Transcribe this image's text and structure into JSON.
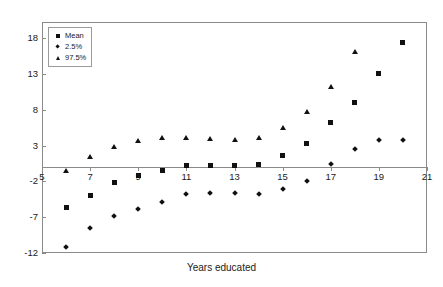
{
  "chart_data": {
    "type": "scatter",
    "title": "",
    "xlabel": "Years educated",
    "ylabel": "",
    "xlim": [
      5,
      21
    ],
    "ylim": [
      -12,
      20.3
    ],
    "grid": false,
    "legend_position": "top-left",
    "xticks": [
      5,
      7,
      9,
      11,
      13,
      15,
      17,
      19,
      21
    ],
    "yticks": [
      18,
      13,
      8,
      3,
      -2,
      -7,
      -12
    ],
    "x": [
      6,
      7,
      8,
      9,
      10,
      11,
      12,
      13,
      14,
      15,
      16,
      17,
      18,
      19,
      20
    ],
    "series": [
      {
        "name": "Mean",
        "marker": "square",
        "color": "#111111",
        "values": [
          -5.7,
          -4.0,
          -2.2,
          -1.2,
          -0.4,
          0.3,
          0.3,
          0.3,
          0.4,
          1.6,
          3.3,
          6.2,
          9.1,
          13.1,
          17.5
        ]
      },
      {
        "name": "2.5%",
        "marker": "diamond",
        "color": "#111111",
        "values": [
          -11.1,
          -8.5,
          -6.8,
          -5.8,
          -4.9,
          -3.8,
          -3.6,
          -3.6,
          -3.8,
          -3.0,
          -1.9,
          0.5,
          2.6,
          3.8,
          3.8
        ]
      },
      {
        "name": "97.5%",
        "marker": "triangle",
        "color": "#111111",
        "values": [
          -0.5,
          1.5,
          2.9,
          3.8,
          4.2,
          4.2,
          4.0,
          3.9,
          4.2,
          5.5,
          7.8,
          11.3,
          16.2,
          null,
          null
        ]
      }
    ]
  },
  "axis": {
    "x_title": "Years educated",
    "x_tick_labels": [
      "5",
      "7",
      "9",
      "11",
      "13",
      "15",
      "17",
      "19",
      "21"
    ],
    "y_tick_labels": [
      "18",
      "13",
      "8",
      "3",
      "-2",
      "-7",
      "-12"
    ]
  },
  "legend": {
    "items": [
      {
        "label": "Mean",
        "marker": "square"
      },
      {
        "label": "2.5%",
        "marker": "diamond"
      },
      {
        "label": "97.5%",
        "marker": "triangle"
      }
    ]
  },
  "colors": {
    "marker": "#111111",
    "axis": "#8a8a8a",
    "text": "#1a1a1a",
    "background": "#ffffff"
  }
}
